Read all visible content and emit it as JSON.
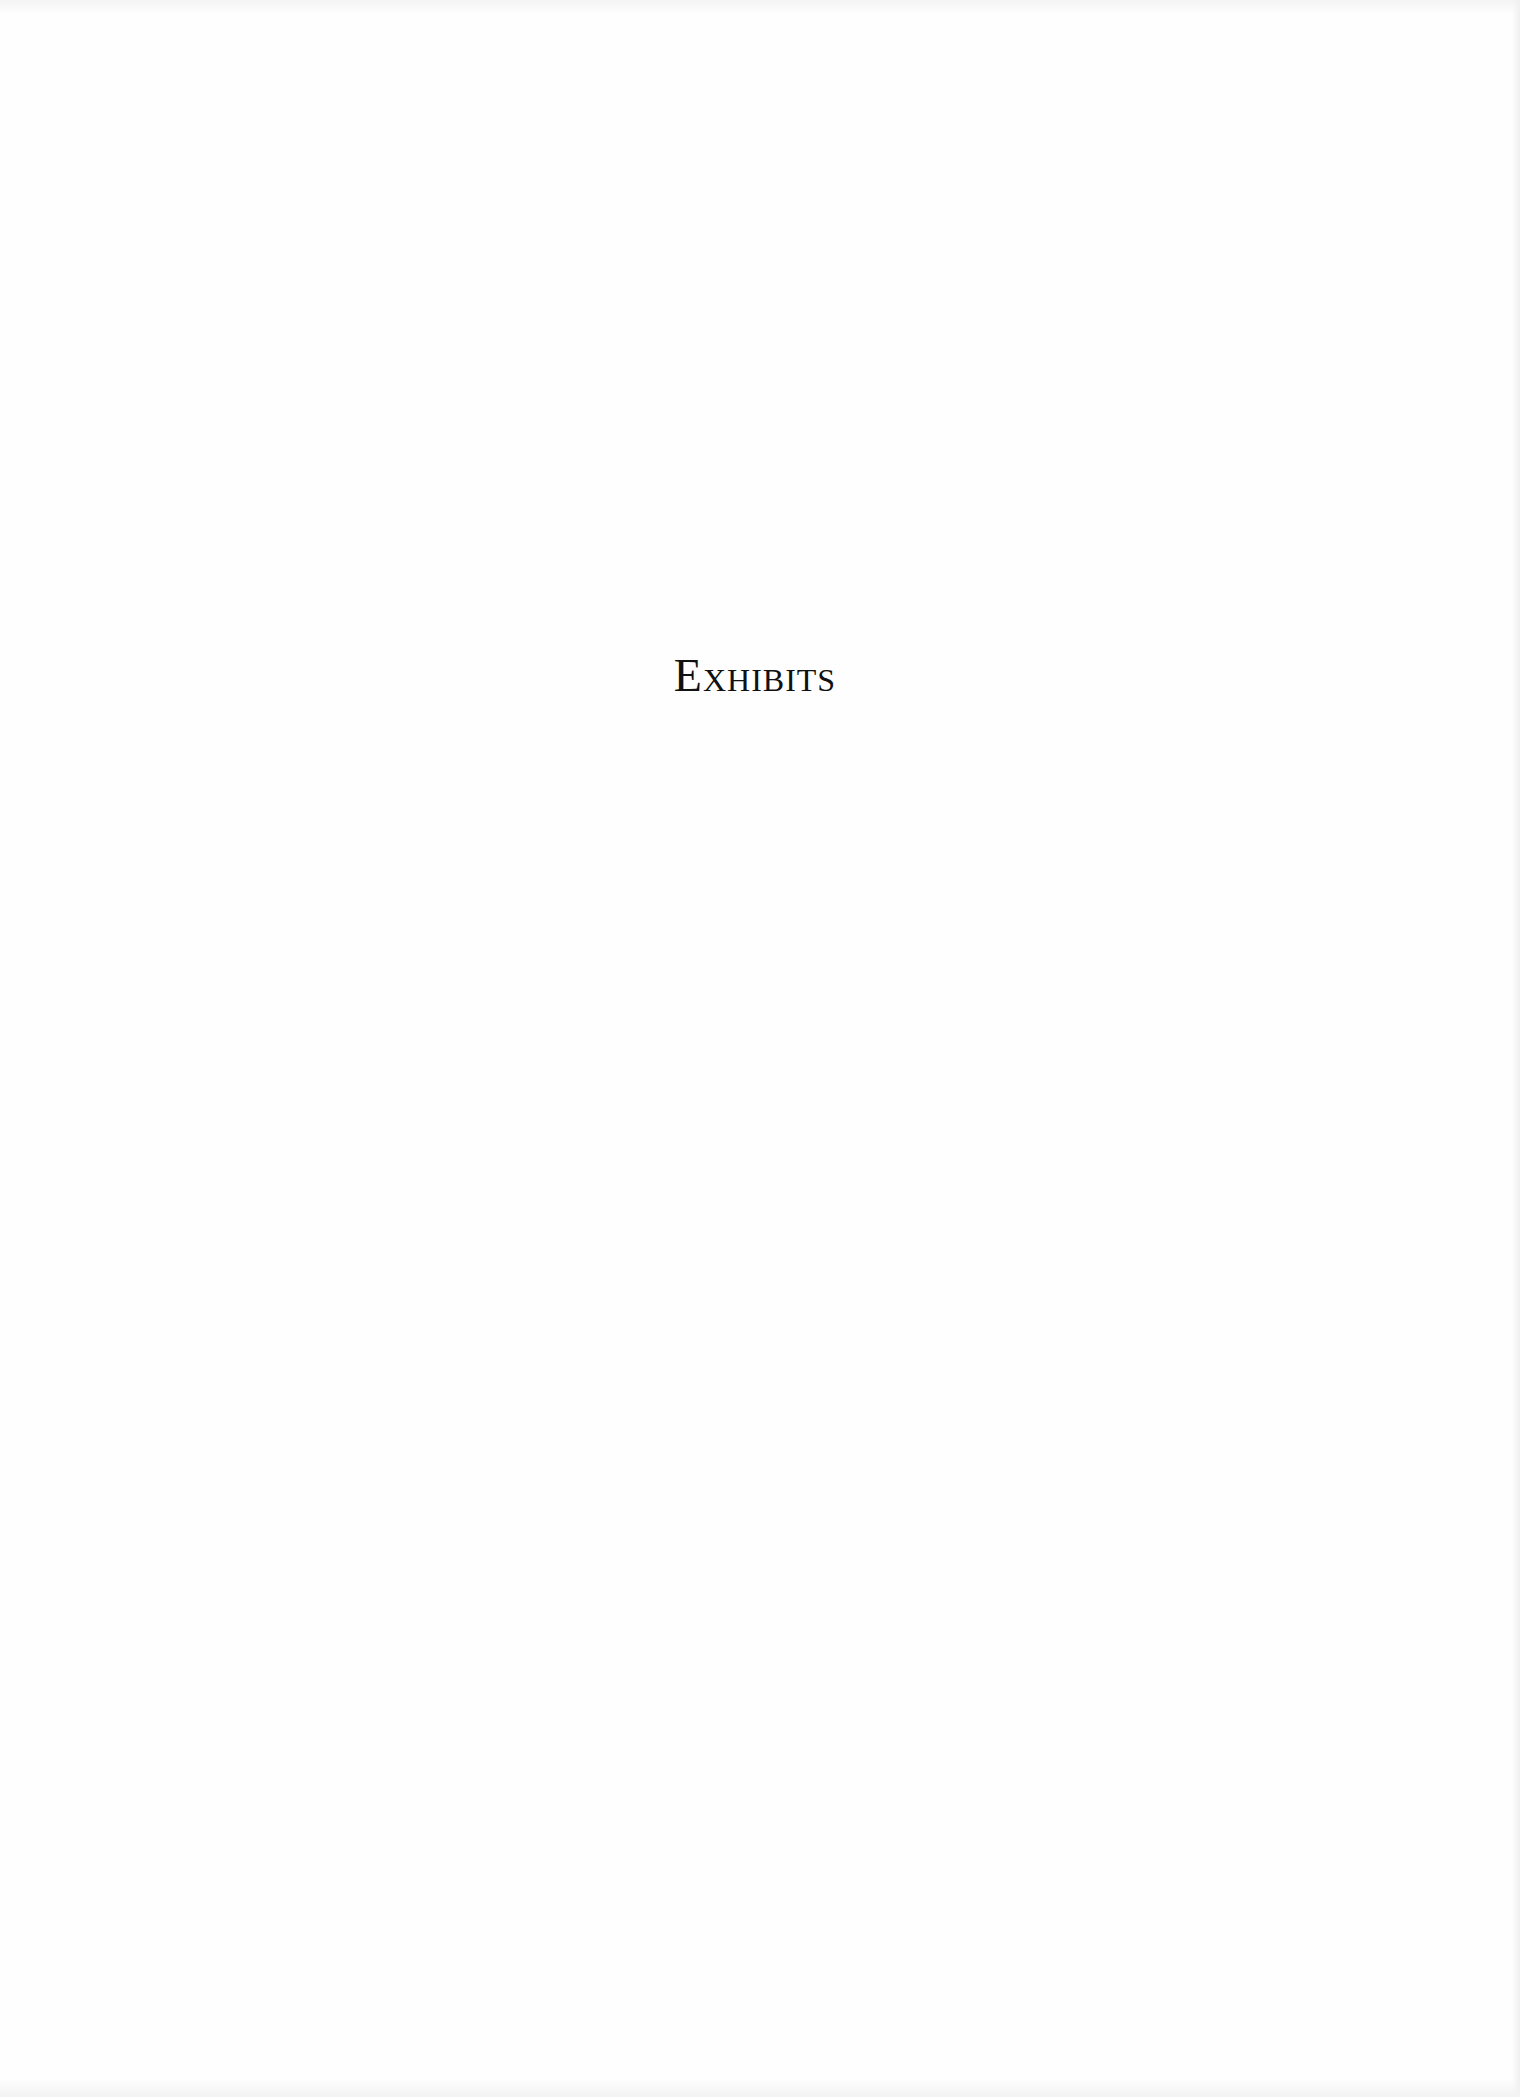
{
  "page": {
    "title": "Exhibits"
  }
}
